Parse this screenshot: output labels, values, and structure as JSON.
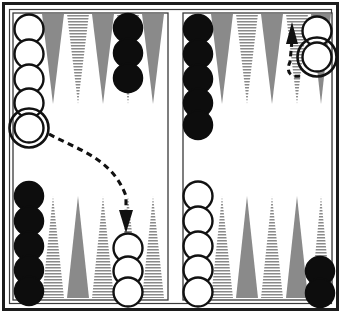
{
  "diagram": {
    "type": "backgammon-board-pair",
    "width": 341,
    "height": 313
  },
  "colors": {
    "background": "#ffffff",
    "frame": "#1c1c1c",
    "point_gray": "#8a8a8a",
    "point_hatch_line": "#8a8a8a",
    "point_hatch_bg": "#ffffff",
    "checker_white_fill": "#ffffff",
    "checker_white_stroke": "#111111",
    "checker_black_fill": "#0d0d0d",
    "checker_black_stroke": "#0d0d0d",
    "arrow": "#111111"
  },
  "boards": [
    {
      "id": "left-board",
      "name": "left-board",
      "label": "Left board (before move)",
      "quadrants": {
        "top": {
          "name": "left-board-top",
          "points": [
            {
              "index": 1,
              "style": "none",
              "checkers": {
                "color": "white",
                "count": 5,
                "highlight_last": true
              }
            },
            {
              "index": 2,
              "style": "gray",
              "checkers": {
                "color": "none",
                "count": 0,
                "highlight_last": false
              }
            },
            {
              "index": 3,
              "style": "hatch",
              "checkers": {
                "color": "none",
                "count": 0,
                "highlight_last": false
              }
            },
            {
              "index": 4,
              "style": "gray",
              "checkers": {
                "color": "none",
                "count": 0,
                "highlight_last": false
              }
            },
            {
              "index": 5,
              "style": "hatch",
              "checkers": {
                "color": "black",
                "count": 3,
                "highlight_last": false
              }
            },
            {
              "index": 6,
              "style": "gray",
              "checkers": {
                "color": "none",
                "count": 0,
                "highlight_last": false
              }
            }
          ]
        },
        "bottom": {
          "name": "left-board-bottom",
          "points": [
            {
              "index": 1,
              "style": "none",
              "checkers": {
                "color": "black",
                "count": 5,
                "highlight_last": false
              }
            },
            {
              "index": 2,
              "style": "hatch",
              "checkers": {
                "color": "none",
                "count": 0,
                "highlight_last": false
              }
            },
            {
              "index": 3,
              "style": "gray",
              "checkers": {
                "color": "none",
                "count": 0,
                "highlight_last": false
              }
            },
            {
              "index": 4,
              "style": "hatch",
              "checkers": {
                "color": "none",
                "count": 0,
                "highlight_last": false
              }
            },
            {
              "index": 5,
              "style": "none",
              "checkers": {
                "color": "white",
                "count": 3,
                "highlight_last": false
              }
            },
            {
              "index": 6,
              "style": "hatch",
              "checkers": {
                "color": "none",
                "count": 0,
                "highlight_last": false
              }
            }
          ]
        }
      },
      "arrow": {
        "name": "move-arrow-left",
        "direction": "down",
        "from": "top-left white checker stack",
        "to": "bottom white point",
        "style": "dashed-curve-with-solid-arrowhead"
      }
    },
    {
      "id": "right-board",
      "name": "right-board",
      "label": "Right board (after move)",
      "quadrants": {
        "top": {
          "name": "right-board-top",
          "points": [
            {
              "index": 1,
              "style": "none",
              "checkers": {
                "color": "black",
                "count": 5,
                "highlight_last": false
              }
            },
            {
              "index": 2,
              "style": "gray",
              "checkers": {
                "color": "none",
                "count": 0,
                "highlight_last": false
              }
            },
            {
              "index": 3,
              "style": "hatch",
              "checkers": {
                "color": "none",
                "count": 0,
                "highlight_last": false
              }
            },
            {
              "index": 4,
              "style": "gray",
              "checkers": {
                "color": "none",
                "count": 0,
                "highlight_last": false
              }
            },
            {
              "index": 5,
              "style": "hatch",
              "checkers": {
                "color": "none",
                "count": 0,
                "highlight_last": false
              }
            },
            {
              "index": 6,
              "style": "gray",
              "checkers": {
                "color": "white",
                "count": 2,
                "highlight_last": true
              }
            }
          ]
        },
        "bottom": {
          "name": "right-board-bottom",
          "points": [
            {
              "index": 1,
              "style": "none",
              "checkers": {
                "color": "white",
                "count": 5,
                "highlight_last": false
              }
            },
            {
              "index": 2,
              "style": "hatch",
              "checkers": {
                "color": "none",
                "count": 0,
                "highlight_last": false
              }
            },
            {
              "index": 3,
              "style": "gray",
              "checkers": {
                "color": "none",
                "count": 0,
                "highlight_last": false
              }
            },
            {
              "index": 4,
              "style": "hatch",
              "checkers": {
                "color": "none",
                "count": 0,
                "highlight_last": false
              }
            },
            {
              "index": 5,
              "style": "gray",
              "checkers": {
                "color": "none",
                "count": 0,
                "highlight_last": false
              }
            },
            {
              "index": 6,
              "style": "hatch",
              "checkers": {
                "color": "black",
                "count": 2,
                "highlight_last": false
              }
            }
          ]
        }
      },
      "arrow": {
        "name": "move-arrow-right",
        "direction": "up",
        "from": "lower white checker",
        "to": "upper point",
        "style": "dashed-curve-with-solid-arrowhead"
      }
    }
  ]
}
